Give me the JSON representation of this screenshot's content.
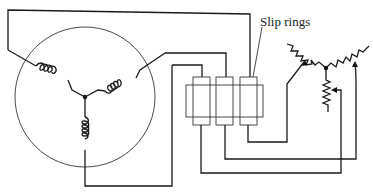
{
  "diagram": {
    "labels": {
      "slip_rings": "Slip rings"
    },
    "components": [
      {
        "id": "rotor",
        "type": "circle",
        "description": "rotor with three Y-connected windings"
      },
      {
        "id": "slip-ring-assembly",
        "type": "slip rings",
        "count": 3
      },
      {
        "id": "rheostat",
        "type": "Y-connected variable resistors",
        "count": 3
      }
    ],
    "colors": {
      "stroke": "#1a1a1a",
      "background": "#ffffff"
    }
  }
}
